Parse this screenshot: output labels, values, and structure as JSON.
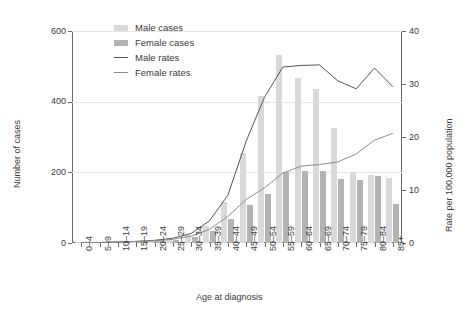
{
  "chart_data": {
    "type": "bar",
    "title": "",
    "xlabel": "Age at diagnosis",
    "ylabel": "Number of cases",
    "y2label": "Rate per 100,000 population",
    "ylim": [
      0,
      600
    ],
    "y2lim": [
      0,
      40
    ],
    "yticks": [
      0,
      200,
      400,
      600
    ],
    "y2ticks": [
      0,
      10,
      20,
      30,
      40
    ],
    "grid": true,
    "legend_position": "top-left-inside",
    "categories": [
      "0–4",
      "5–9",
      "10–14",
      "15–19",
      "20–24",
      "25–29",
      "30–34",
      "35–39",
      "40–44",
      "45–49",
      "50–54",
      "55–59",
      "60–64",
      "65–69",
      "70–74",
      "75–79",
      "80–84",
      "85+"
    ],
    "series": [
      {
        "name": "Male cases",
        "kind": "bar",
        "axis": "left",
        "color": "#d9d9d9",
        "values": [
          1,
          1,
          2,
          3,
          6,
          11,
          22,
          47,
          117,
          255,
          417,
          533,
          467,
          437,
          325,
          200,
          193,
          185
        ]
      },
      {
        "name": "Female cases",
        "kind": "bar",
        "axis": "left",
        "color": "#b3b3b3",
        "values": [
          1,
          1,
          2,
          3,
          5,
          9,
          17,
          33,
          69,
          108,
          140,
          200,
          205,
          203,
          182,
          178,
          190,
          110
        ]
      },
      {
        "name": "Male rates",
        "kind": "line",
        "axis": "right",
        "color": "#555555",
        "values": [
          0.1,
          0.1,
          0.2,
          0.3,
          0.5,
          0.9,
          1.8,
          4.2,
          9.0,
          19.2,
          27.5,
          33.2,
          33.5,
          33.6,
          30.6,
          29.1,
          33.0,
          29.5
        ]
      },
      {
        "name": "Female rates",
        "kind": "line",
        "axis": "right",
        "color": "#8d8d8d",
        "values": [
          0.1,
          0.1,
          0.2,
          0.3,
          0.4,
          0.7,
          1.3,
          2.6,
          5.0,
          8.2,
          10.4,
          13.2,
          14.5,
          14.8,
          15.3,
          16.8,
          19.4,
          20.7
        ]
      }
    ]
  },
  "legend": {
    "items": [
      {
        "label": "Male cases",
        "marker": "swatch-male"
      },
      {
        "label": "Female cases",
        "marker": "swatch-female"
      },
      {
        "label": "Male rates",
        "marker": "line-male"
      },
      {
        "label": "Female rates",
        "marker": "line-female"
      }
    ]
  }
}
